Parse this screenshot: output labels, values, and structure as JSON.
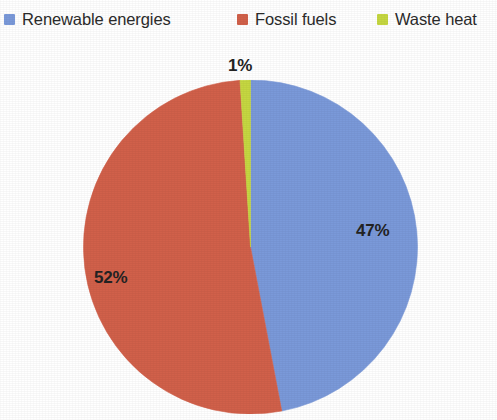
{
  "legend": {
    "position": "top",
    "items": [
      {
        "label": "Renewable energies",
        "color": "#7a99d9",
        "swatch_icon": "square-swatch-icon"
      },
      {
        "label": "Fossil fuels",
        "color": "#d1604a",
        "swatch_icon": "square-swatch-icon"
      },
      {
        "label": "Waste heat",
        "color": "#c5d741",
        "swatch_icon": "square-swatch-icon"
      }
    ]
  },
  "labels": {
    "renewable": "47%",
    "fossil": "52%",
    "waste": "1%"
  },
  "chart_data": {
    "type": "pie",
    "title": "",
    "subtitle": "",
    "xlabel": "",
    "ylabel": "",
    "grid": false,
    "legend_position": "top",
    "units": "percent",
    "start_angle_deg": 0,
    "direction": "clockwise",
    "categories": [
      "Renewable energies",
      "Fossil fuels",
      "Waste heat"
    ],
    "values": [
      47,
      52,
      1
    ],
    "colors": [
      "#7a99d9",
      "#d1604a",
      "#c5d741"
    ],
    "data_labels": [
      "47%",
      "52%",
      "1%"
    ],
    "total": 100
  }
}
